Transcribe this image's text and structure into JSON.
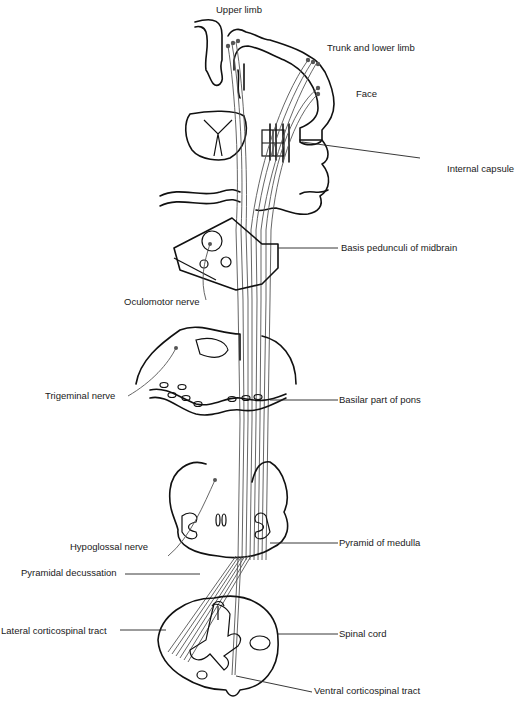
{
  "figure": {
    "labels": {
      "upper_limb": "Upper limb",
      "trunk_lower_limb": "Trunk and  lower limb",
      "face": "Face",
      "internal_capsule": "Internal capsule",
      "basis_pedunculi": "Basis pedunculi of midbrain",
      "oculomotor_nerve": "Oculomotor nerve",
      "trigeminal_nerve": "Trigeminal nerve",
      "basilar_pons": "Basilar part of pons",
      "hypoglossal_nerve": "Hypoglossal nerve",
      "pyramid_medulla": "Pyramid of medulla",
      "pyramidal_decussation": "Pyramidal decussation",
      "lateral_cst": "Lateral corticospinal tract",
      "spinal_cord": "Spinal cord",
      "ventral_cst": "Ventral corticospinal tract"
    },
    "colors": {
      "line": "#111111",
      "fiber": "#555555",
      "background": "#ffffff"
    }
  }
}
